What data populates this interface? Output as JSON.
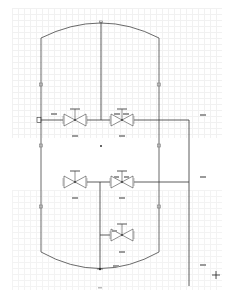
{
  "diagram": {
    "type": "P&ID vessel schematic",
    "colors": {
      "line": "#333333",
      "valve": "#555555",
      "label": "#888888",
      "grid": "#f1f1f1"
    },
    "vessel": {
      "left_x": 41,
      "right_x": 159,
      "top_side_y": 38,
      "top_peak_y": 22,
      "bottom_side_y": 252,
      "bottom_peak_y": 269
    },
    "valves": [
      {
        "id": "v1",
        "label": "XXX",
        "tag": "XXX",
        "x": 75,
        "y": 120
      },
      {
        "id": "v2",
        "label": "XXX",
        "tag": "XXX XXX",
        "x": 122,
        "y": 120
      },
      {
        "id": "v3",
        "label": "XXX",
        "tag": "",
        "x": 75,
        "y": 182
      },
      {
        "id": "v4",
        "label": "XXX",
        "tag": "XXX XXX",
        "x": 122,
        "y": 182
      },
      {
        "id": "v5",
        "label": "XXX",
        "tag": "XXX",
        "x": 122,
        "y": 235
      }
    ],
    "side_labels": [
      {
        "text": "XXX",
        "x": 203,
        "y": 115
      },
      {
        "text": "XXX",
        "x": 203,
        "y": 177
      },
      {
        "text": "XXX",
        "x": 203,
        "y": 265
      },
      {
        "text": "XXX",
        "x": 116,
        "y": 266
      }
    ],
    "page_label": "1 / 1",
    "crosshair": {
      "x": 216,
      "y": 275
    }
  }
}
